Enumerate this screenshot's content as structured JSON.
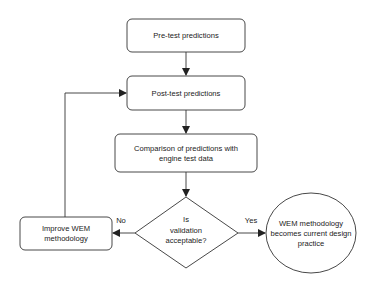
{
  "diagram": {
    "type": "flowchart",
    "colors": {
      "stroke": "#333333",
      "fill": "#ffffff",
      "text": "#222222"
    },
    "nodes": {
      "pretest": {
        "shape": "rounded-rect",
        "lines": [
          "Pre-test predictions"
        ]
      },
      "posttest": {
        "shape": "rounded-rect",
        "lines": [
          "Post-test predictions"
        ]
      },
      "comparison": {
        "shape": "rounded-rect",
        "lines": [
          "Comparison of predictions with",
          "engine test data"
        ]
      },
      "decision": {
        "shape": "diamond",
        "lines": [
          "Is",
          "validation",
          "acceptable?"
        ]
      },
      "improve": {
        "shape": "rounded-rect",
        "lines": [
          "Improve WEM",
          "methodology"
        ]
      },
      "outcome": {
        "shape": "ellipse",
        "lines": [
          "WEM methodology",
          "becomes current design",
          "practice"
        ]
      }
    },
    "edges": [
      {
        "from": "pretest",
        "to": "posttest",
        "label": ""
      },
      {
        "from": "posttest",
        "to": "comparison",
        "label": ""
      },
      {
        "from": "comparison",
        "to": "decision",
        "label": ""
      },
      {
        "from": "decision",
        "to": "improve",
        "label": "No"
      },
      {
        "from": "decision",
        "to": "outcome",
        "label": "Yes"
      },
      {
        "from": "improve",
        "to": "posttest",
        "label": ""
      }
    ],
    "labels": {
      "no": "No",
      "yes": "Yes"
    }
  }
}
